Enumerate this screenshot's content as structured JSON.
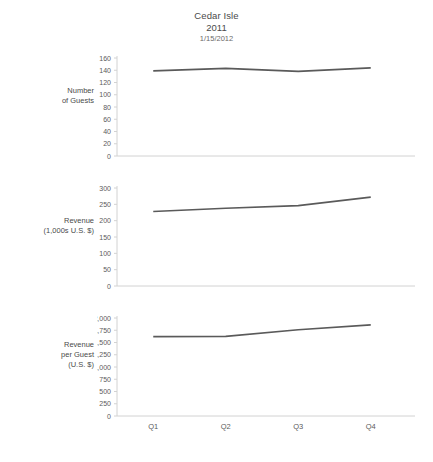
{
  "title": {
    "name": "Cedar Isle",
    "year": "2011",
    "date": "1/15/2012"
  },
  "colors": {
    "line": "#5a5a5a",
    "axis": "#d2d2d2",
    "text": "#5b5b5b"
  },
  "categories": [
    "Q1",
    "Q2",
    "Q3",
    "Q4"
  ],
  "panels": [
    {
      "key": "guests",
      "axis_title": "Number\nof Guests",
      "axis_title_lines": [
        "Number",
        "of Guests"
      ],
      "ticks": [
        "160",
        "140",
        "120",
        "100",
        "80",
        "60",
        "40",
        "20",
        "0"
      ]
    },
    {
      "key": "revenue",
      "axis_title_lines": [
        "Revenue",
        "(1,000s U.S. $)"
      ],
      "ticks": [
        "300",
        "250",
        "200",
        "150",
        "100",
        "50",
        "0"
      ]
    },
    {
      "key": "perguest",
      "axis_title_lines": [
        "Revenue",
        "per Guest",
        "(U.S. $)"
      ],
      "ticks": [
        "2,000",
        "1,750",
        "1,500",
        "1,250",
        "1,000",
        "750",
        "500",
        "250",
        "0"
      ]
    }
  ],
  "chart_data": [
    {
      "type": "line",
      "title": "Cedar Isle 2011",
      "subtitle": "1/15/2012",
      "xlabel": "",
      "ylabel": "Number of Guests",
      "categories": [
        "Q1",
        "Q2",
        "Q3",
        "Q4"
      ],
      "values": [
        139,
        143,
        138,
        144
      ],
      "ylim": [
        0,
        160
      ],
      "ytick_step": 20,
      "grid": false,
      "legend": "none"
    },
    {
      "type": "line",
      "title": "Cedar Isle 2011",
      "subtitle": "1/15/2012",
      "xlabel": "",
      "ylabel": "Revenue (1,000s U.S. $)",
      "categories": [
        "Q1",
        "Q2",
        "Q3",
        "Q4"
      ],
      "values": [
        228,
        238,
        246,
        272
      ],
      "ylim": [
        0,
        300
      ],
      "ytick_step": 50,
      "grid": false,
      "legend": "none"
    },
    {
      "type": "line",
      "title": "Cedar Isle 2011",
      "subtitle": "1/15/2012",
      "xlabel": "",
      "ylabel": "Revenue per Guest (U.S. $)",
      "categories": [
        "Q1",
        "Q2",
        "Q3",
        "Q4"
      ],
      "values": [
        1620,
        1625,
        1760,
        1860
      ],
      "ylim": [
        0,
        2000
      ],
      "ytick_step": 250,
      "grid": false,
      "legend": "none"
    }
  ]
}
